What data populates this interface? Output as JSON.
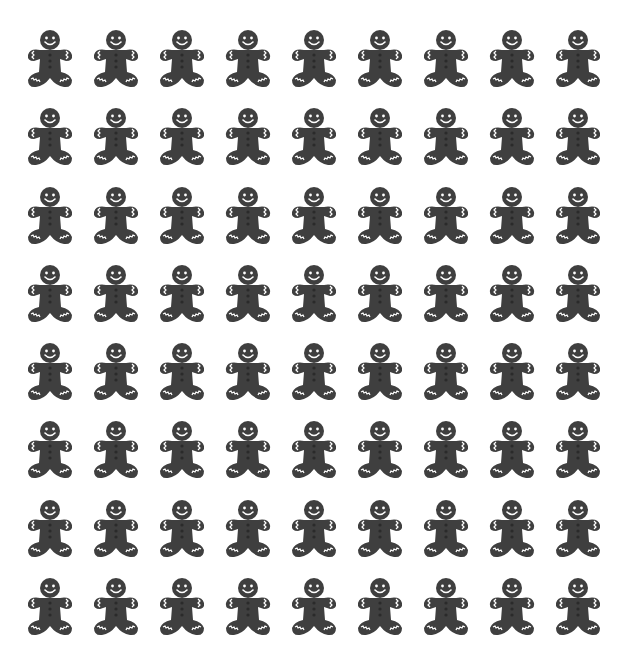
{
  "grid": {
    "rows": 8,
    "columns": 9,
    "icon": "gingerbread-man-icon",
    "count": 72
  },
  "colors": {
    "icon_fill": "#3f3f3f",
    "icon_detail": "#ffffff",
    "background": "#ffffff"
  }
}
